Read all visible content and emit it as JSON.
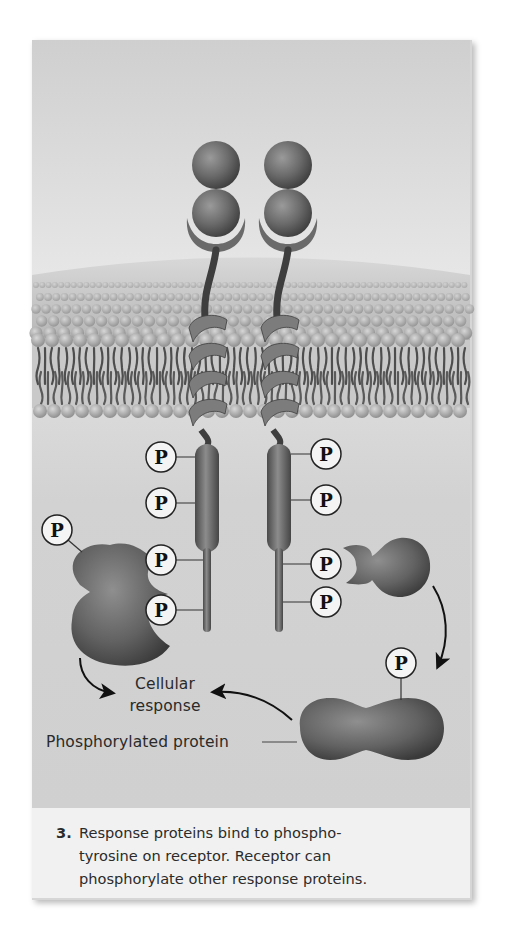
{
  "figure": {
    "step_number": "3.",
    "caption_lines": [
      "Response proteins bind to phospho-",
      "tyrosine on receptor. Receptor can",
      "phosphorylate other response proteins."
    ],
    "labels": {
      "cellular_response_line1": "Cellular",
      "cellular_response_line2": "response",
      "phosphorylated_protein": "Phosphorylated protein"
    },
    "phosphate_symbol": "P",
    "colors": {
      "background": "#d6d6d6",
      "protein": "#6e6e6e",
      "phosphate_fill": "#f4f4f4",
      "text": "#2a2a2a",
      "caption_bg": "#f1f1f1"
    },
    "receptors": [
      {
        "id": "left",
        "x": 207,
        "phosphates": [
          {
            "x": 161,
            "y": 457
          },
          {
            "x": 161,
            "y": 503
          },
          {
            "x": 161,
            "y": 560
          },
          {
            "x": 161,
            "y": 610
          }
        ]
      },
      {
        "id": "right",
        "x": 279,
        "phosphates": [
          {
            "x": 326,
            "y": 454
          },
          {
            "x": 326,
            "y": 500
          },
          {
            "x": 326,
            "y": 564
          },
          {
            "x": 326,
            "y": 602
          }
        ]
      }
    ],
    "extra_phosphates": [
      {
        "name": "left-response-protein-phosphate",
        "x": 57,
        "y": 530
      },
      {
        "name": "phosphorylated-protein-phosphate",
        "x": 401,
        "y": 663
      }
    ]
  }
}
